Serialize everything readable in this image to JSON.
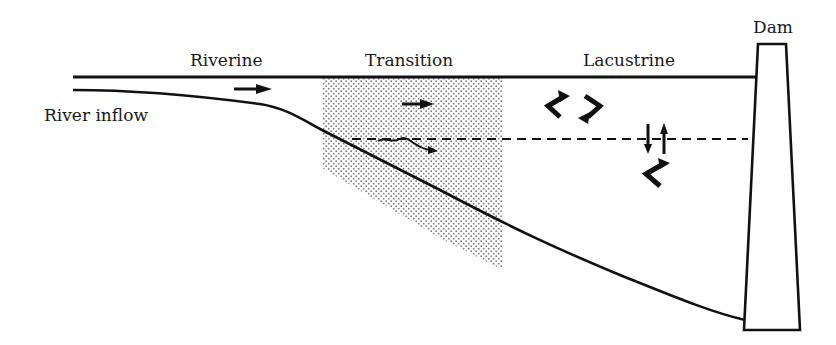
{
  "diagram": {
    "zones": [
      {
        "id": "riverine",
        "label": "Riverine"
      },
      {
        "id": "transition",
        "label": "Transition"
      },
      {
        "id": "lacustrine",
        "label": "Lacustrine"
      }
    ],
    "labels": {
      "river_inflow": "River inflow",
      "dam": "Dam"
    },
    "features": {
      "transition_shading": "stippled",
      "thermocline_line": "dashed",
      "flow_arrows": [
        "riverine-horizontal",
        "transition-horizontal",
        "transition-interflow",
        "lacustrine-mixing-cycle",
        "lacustrine-vertical-exchange",
        "lacustrine-return"
      ]
    },
    "colors": {
      "line": "#111111",
      "stipple": "#7a7a7a",
      "background": "#ffffff"
    }
  }
}
